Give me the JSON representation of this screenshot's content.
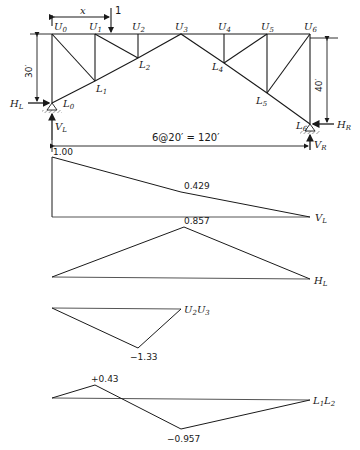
{
  "truss": {
    "upper_nodes": [
      "U0",
      "U1",
      "U2",
      "U3",
      "U4",
      "U5",
      "U6"
    ],
    "lower_nodes": [
      "L0",
      "L1",
      "L2",
      "L3",
      "L4",
      "L5",
      "L6"
    ],
    "load_label": "1",
    "x_label": "x",
    "left_height": "30′",
    "right_height": "40′",
    "span_label": "6@20′ = 120′",
    "reactions": {
      "hl": "H",
      "hl_sub": "L",
      "vl": "V",
      "vl_sub": "L",
      "hr": "H",
      "hr_sub": "R",
      "vr": "V",
      "vr_sub": "R"
    }
  },
  "influence_lines": [
    {
      "id": "VL",
      "label_main": "V",
      "label_sub": "L",
      "values": [
        {
          "x": 0,
          "v": 1.0,
          "label": "1.00"
        },
        {
          "x": 60,
          "v": 0.429,
          "label": "0.429"
        },
        {
          "x": 120,
          "v": 0
        }
      ]
    },
    {
      "id": "HL",
      "label_main": "H",
      "label_sub": "L",
      "values": [
        {
          "x": 0,
          "v": 0
        },
        {
          "x": 60,
          "v": 0.857,
          "label": "0.857"
        },
        {
          "x": 120,
          "v": 0
        }
      ]
    },
    {
      "id": "U2U3",
      "label_main": "U",
      "label_sub": "2",
      "label_main2": "U",
      "label_sub2": "3",
      "values": [
        {
          "x": 0,
          "v": 0
        },
        {
          "x": 40,
          "v": -1.33,
          "label": "−1.33"
        },
        {
          "x": 60,
          "v": 0
        }
      ]
    },
    {
      "id": "L1L2",
      "label_main": "L",
      "label_sub": "1",
      "label_main2": "L",
      "label_sub2": "2",
      "values": [
        {
          "x": 0,
          "v": 0
        },
        {
          "x": 20,
          "v": 0.43,
          "label": "+0.43"
        },
        {
          "x": 60,
          "v": -0.957,
          "label": "−0.957"
        },
        {
          "x": 120,
          "v": 0
        }
      ]
    }
  ]
}
